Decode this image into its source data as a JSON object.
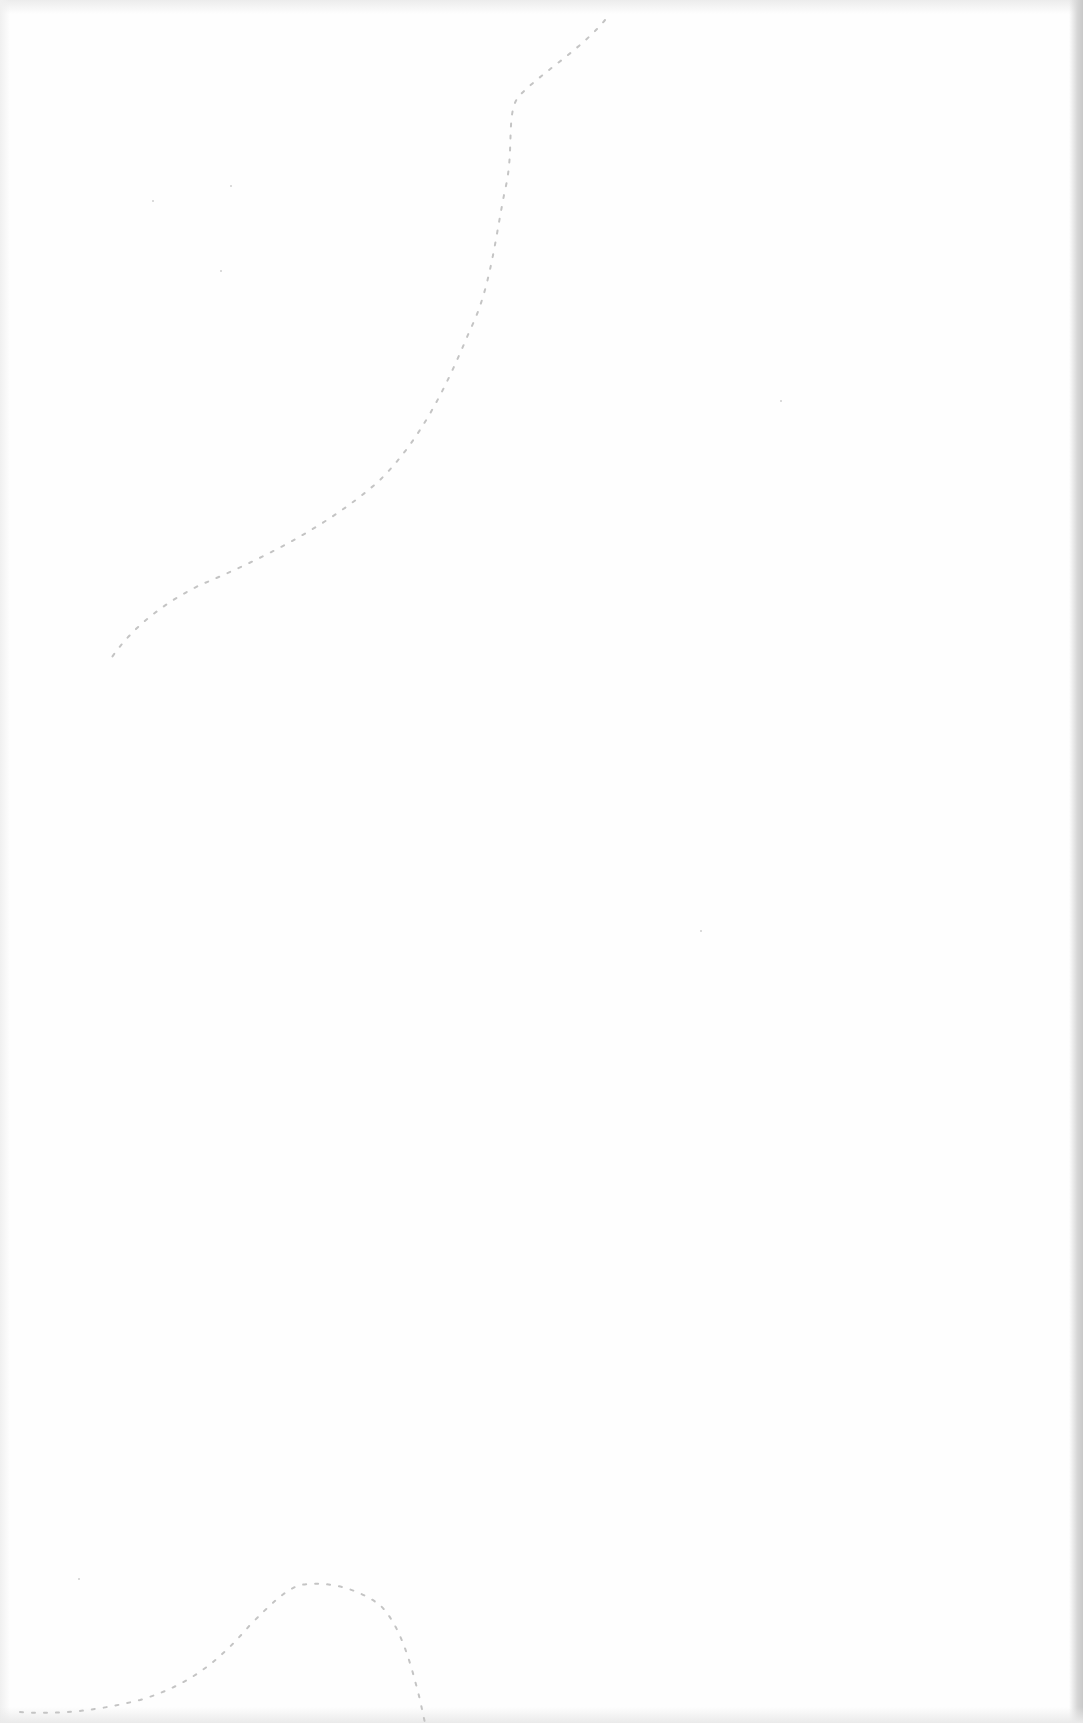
{
  "document": {
    "kind": "blank scanned page",
    "text_content": "",
    "paper_color": "#fefefe",
    "edge_shadow_color": "#c8c8c8",
    "crease_color": "#c4c4c4"
  }
}
